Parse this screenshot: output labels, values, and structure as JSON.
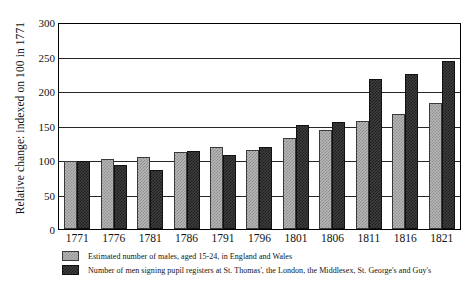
{
  "chart_data": {
    "type": "bar",
    "title": "",
    "xlabel": "",
    "ylabel": "Relative change: indexed on 100 in 1771",
    "ylim": [
      0,
      300
    ],
    "yticks": [
      0,
      50,
      100,
      150,
      200,
      250,
      300
    ],
    "grid": true,
    "legend_position": "below",
    "categories": [
      "1771",
      "1776",
      "1781",
      "1786",
      "1791",
      "1796",
      "1801",
      "1806",
      "1811",
      "1816",
      "1821"
    ],
    "series": [
      {
        "name": "Estimated number of males, aged 15-24, in England and Wales",
        "color": "#b7b7b7",
        "values": [
          100,
          103,
          105,
          112,
          120,
          115,
          133,
          145,
          158,
          168,
          184
        ]
      },
      {
        "name": "Number of men signing pupil registers at St. Thomas', the London, the Middlesex, St. George's and Guy's",
        "color": "#3f3f3f",
        "values": [
          100,
          94,
          87,
          114,
          108,
          120,
          152,
          156,
          220,
          227,
          246
        ]
      }
    ]
  },
  "legend": {
    "items": [
      {
        "label": "Estimated number of males, aged 15-24, in England and Wales"
      },
      {
        "label": "Number of men signing pupil registers at St. Thomas', the London, the Middlesex, St. George's and Guy's"
      }
    ]
  }
}
